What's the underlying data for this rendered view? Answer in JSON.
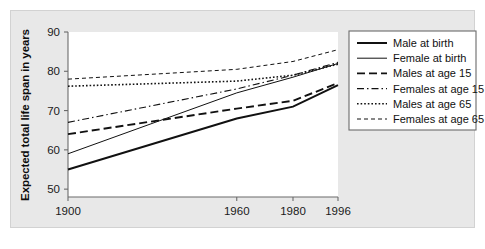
{
  "chart_data": {
    "type": "line",
    "title": "",
    "xlabel": "",
    "ylabel": "Expected total life span in years",
    "x": [
      1900,
      1960,
      1980,
      1996
    ],
    "xtick_labels": [
      "1900",
      "1960",
      "1980",
      "1996"
    ],
    "ytick_labels": [
      "50",
      "60",
      "70",
      "80",
      "90"
    ],
    "yticks": [
      50,
      60,
      70,
      80,
      90
    ],
    "ylim": [
      48,
      90
    ],
    "xlim": [
      1900,
      1996
    ],
    "grid": false,
    "legend_position": "right-outside",
    "series": [
      {
        "name": "Male at birth",
        "style": "solid-thick",
        "values": [
          55,
          68,
          71,
          76.5
        ]
      },
      {
        "name": "Female at birth",
        "style": "solid-thin",
        "values": [
          59,
          74.5,
          78.5,
          82
        ]
      },
      {
        "name": "Males at age 15",
        "style": "long-dash",
        "values": [
          64,
          70.5,
          72.5,
          77
        ]
      },
      {
        "name": "Females at age 15",
        "style": "dash-dot",
        "values": [
          67,
          75.5,
          79,
          82.3
        ]
      },
      {
        "name": "Males at age 65",
        "style": "dotted",
        "values": [
          76.2,
          77.5,
          79,
          81.8
        ]
      },
      {
        "name": "Females at age 65",
        "style": "short-dash",
        "values": [
          78,
          80.5,
          82.5,
          85.5
        ]
      }
    ]
  },
  "legend": {
    "items": [
      {
        "label": "Male at birth"
      },
      {
        "label": "Female at birth"
      },
      {
        "label": "Males at age 15"
      },
      {
        "label": "Females at age 15"
      },
      {
        "label": "Males at age 65"
      },
      {
        "label": "Females at age 65"
      }
    ]
  },
  "colors": {
    "line": "#111111",
    "axis": "#6b6b6b",
    "plot_background": "#ffffff",
    "figure_background": "#e8e8e8",
    "text": "#111111"
  }
}
